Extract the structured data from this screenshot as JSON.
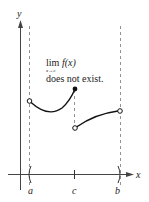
{
  "axes": {
    "x_label": "x",
    "y_label": "y"
  },
  "ticks": {
    "a": "a",
    "c": "c",
    "b": "b"
  },
  "annotation": {
    "lim": "lim",
    "func": "f(x)",
    "sub": "x→c",
    "line2": "does not exist."
  },
  "colors": {
    "curve": "#111111",
    "axis": "#333333",
    "dashed": "#666666"
  }
}
